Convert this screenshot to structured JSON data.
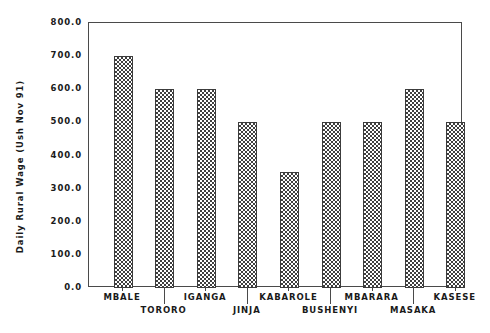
{
  "chart_data": {
    "type": "bar",
    "title": "",
    "xlabel": "",
    "ylabel": "Daily Rural Wage (Ush Nov 91)",
    "categories": [
      "MBALE",
      "TORORO",
      "IGANGA",
      "JINJA",
      "KABAROLE",
      "BUSHENYI",
      "MBARARA",
      "MASAKA",
      "KASESE"
    ],
    "values": [
      700,
      600,
      600,
      500,
      350,
      500,
      500,
      600,
      500
    ],
    "ylim": [
      0,
      800
    ],
    "yticks": [
      0,
      100,
      200,
      300,
      400,
      500,
      600,
      700,
      800
    ],
    "ytick_labels": [
      "0.0",
      "100.0",
      "200.0",
      "300.0",
      "400.0",
      "500.0",
      "600.0",
      "700.0",
      "800.0"
    ],
    "grid": false,
    "legend": false,
    "bar_fill": "checkerboard-hatch",
    "bar_edge_color": "#3c3c3c",
    "axis_color": "#4a4a4a",
    "background_color": "#ffffff",
    "text_color": "#1a1a1a",
    "xlabel_rows": [
      0,
      1,
      0,
      1,
      0,
      1,
      0,
      1,
      0
    ]
  }
}
